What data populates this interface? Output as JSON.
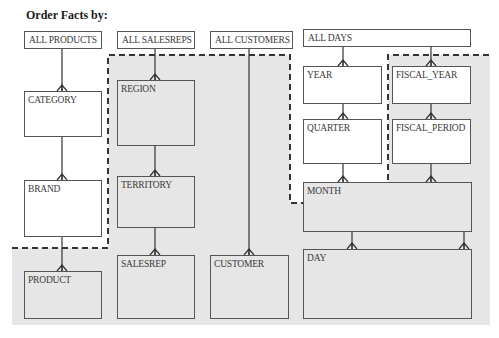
{
  "title": "Order Facts by:",
  "colors": {
    "shaded_region": "#e6e6e6",
    "box_border": "#555555",
    "dashed_border": "#333333",
    "background": "#ffffff"
  },
  "hierarchies": [
    {
      "name": "products",
      "levels": [
        "ALL PRODUCTS",
        "CATEGORY",
        "BRAND",
        "PRODUCT"
      ]
    },
    {
      "name": "salesreps",
      "levels": [
        "ALL SALESREPS",
        "REGION",
        "TERRITORY",
        "SALESREP"
      ]
    },
    {
      "name": "customers",
      "levels": [
        "ALL CUSTOMERS",
        "CUSTOMER"
      ]
    },
    {
      "name": "days",
      "levels": [
        "ALL DAYS",
        "YEAR",
        "QUARTER",
        "FISCAL_YEAR",
        "FISCAL_PERIOD",
        "MONTH",
        "DAY"
      ]
    }
  ],
  "boxes": {
    "all_products": "ALL PRODUCTS",
    "category": "CATEGORY",
    "brand": "BRAND",
    "product": "PRODUCT",
    "all_salesreps": "ALL SALESREPS",
    "region": "REGION",
    "territory": "TERRITORY",
    "salesrep": "SALESREP",
    "all_customers": "ALL CUSTOMERS",
    "customer": "CUSTOMER",
    "all_days": "ALL DAYS",
    "year": "YEAR",
    "quarter": "QUARTER",
    "fiscal_year": "FISCAL_YEAR",
    "fiscal_period": "FISCAL_PERIOD",
    "month": "MONTH",
    "day": "DAY"
  },
  "relationships": [
    {
      "parent": "ALL PRODUCTS",
      "child": "CATEGORY"
    },
    {
      "parent": "CATEGORY",
      "child": "BRAND"
    },
    {
      "parent": "BRAND",
      "child": "PRODUCT"
    },
    {
      "parent": "ALL SALESREPS",
      "child": "REGION"
    },
    {
      "parent": "REGION",
      "child": "TERRITORY"
    },
    {
      "parent": "TERRITORY",
      "child": "SALESREP"
    },
    {
      "parent": "ALL CUSTOMERS",
      "child": "CUSTOMER"
    },
    {
      "parent": "ALL DAYS",
      "child": "YEAR"
    },
    {
      "parent": "YEAR",
      "child": "QUARTER"
    },
    {
      "parent": "QUARTER",
      "child": "MONTH"
    },
    {
      "parent": "ALL DAYS",
      "child": "FISCAL_YEAR"
    },
    {
      "parent": "FISCAL_YEAR",
      "child": "FISCAL_PERIOD"
    },
    {
      "parent": "FISCAL_PERIOD",
      "child": "MONTH"
    },
    {
      "parent": "MONTH",
      "child": "DAY"
    }
  ]
}
